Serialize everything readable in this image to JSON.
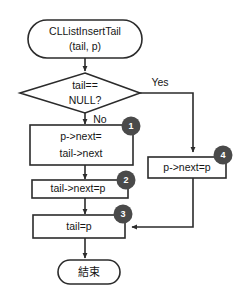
{
  "diagram": {
    "type": "flowchart",
    "title_text": "CLListInsertTail",
    "colors": {
      "stroke": "#2b2b2b",
      "node_fill": "#ffffff",
      "text": "#151515",
      "badge_fill": "#4a4a4a",
      "badge_text": "#ffffff",
      "background": "#ffffff"
    },
    "nodes": [
      {
        "id": "start",
        "shape": "terminator",
        "name": "start-node",
        "lines": [
          "CLListInsertTail",
          "(tail, p)"
        ],
        "line1": "CLListInsertTail",
        "line2": "(tail, p)"
      },
      {
        "id": "decision",
        "shape": "diamond",
        "name": "decision-tail-null",
        "lines": [
          "tail==",
          "NULL?"
        ],
        "line1": "tail==",
        "line2": "NULL?"
      },
      {
        "id": "process1",
        "shape": "rect",
        "name": "process-p-next-tail-next",
        "badge": "1",
        "lines": [
          "p->next=",
          "tail->next"
        ],
        "line1": "p->next=",
        "line2": "tail->next"
      },
      {
        "id": "process2",
        "shape": "rect",
        "name": "process-tail-next-p",
        "badge": "2",
        "lines": [
          "tail->next=p"
        ],
        "line1": "tail->next=p"
      },
      {
        "id": "process3",
        "shape": "rect",
        "name": "process-tail-p",
        "badge": "3",
        "lines": [
          "tail=p"
        ],
        "line1": "tail=p"
      },
      {
        "id": "process4",
        "shape": "rect",
        "name": "process-p-next-p",
        "badge": "4",
        "lines": [
          "p->next=p"
        ],
        "line1": "p->next=p"
      },
      {
        "id": "end",
        "shape": "terminator",
        "name": "end-node",
        "lines": [
          "結束"
        ],
        "line1": "結束"
      }
    ],
    "edge_labels": {
      "yes": "Yes",
      "no": "No"
    },
    "badges": {
      "one": "1",
      "two": "2",
      "three": "3",
      "four": "4"
    }
  }
}
